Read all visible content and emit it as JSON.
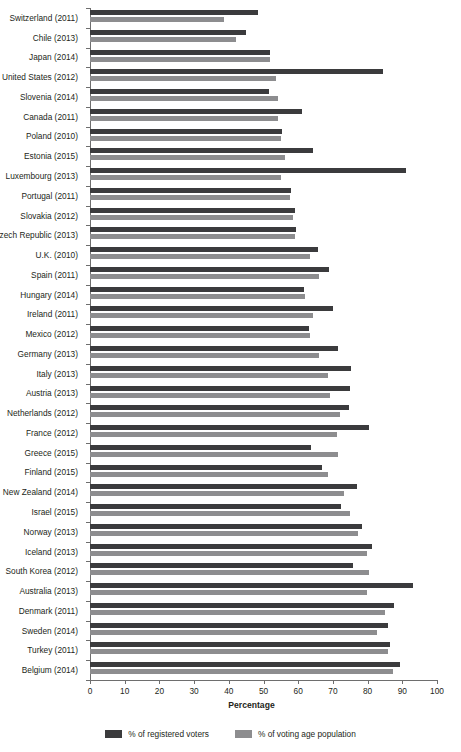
{
  "chart_data": {
    "type": "bar",
    "orientation": "horizontal",
    "title": "",
    "xlabel": "Percentage",
    "ylabel": "",
    "xlim": [
      0,
      100
    ],
    "xticks": [
      0,
      10,
      20,
      30,
      40,
      50,
      60,
      70,
      80,
      90,
      100
    ],
    "grid": false,
    "legend_position": "bottom",
    "categories": [
      "Switzerland (2011)",
      "Chile (2013)",
      "Japan (2014)",
      "United States (2012)",
      "Slovenia (2014)",
      "Canada (2011)",
      "Poland (2010)",
      "Estonia (2015)",
      "Luxembourg (2013)",
      "Portugal (2011)",
      "Slovakia (2012)",
      "Czech Republic (2013)",
      "U.K. (2010)",
      "Spain (2011)",
      "Hungary (2014)",
      "Ireland (2011)",
      "Mexico (2012)",
      "Germany (2013)",
      "Italy (2013)",
      "Austria (2013)",
      "Netherlands (2012)",
      "France (2012)",
      "Greece (2015)",
      "Finland (2015)",
      "New Zealand (2014)",
      "Israel (2015)",
      "Norway (2013)",
      "Iceland (2013)",
      "South Korea (2012)",
      "Australia (2013)",
      "Denmark (2011)",
      "Sweden (2014)",
      "Turkey (2011)",
      "Belgium (2014)"
    ],
    "series": [
      {
        "name": "% of registered voters",
        "color": "#3b3b3d",
        "values": [
          48.5,
          45.0,
          52.0,
          84.3,
          51.7,
          61.1,
          55.3,
          64.2,
          91.2,
          58.0,
          59.1,
          59.5,
          65.8,
          68.9,
          61.8,
          69.9,
          63.1,
          71.5,
          75.2,
          74.9,
          74.6,
          80.3,
          63.6,
          66.8,
          77.0,
          72.3,
          78.3,
          81.4,
          75.8,
          93.2,
          87.7,
          85.8,
          86.4,
          89.4
        ],
        "unit": "%"
      },
      {
        "name": "% of voting age population",
        "color": "#8d8d8f",
        "values": [
          38.6,
          42.0,
          51.8,
          53.6,
          54.1,
          54.2,
          55.0,
          56.2,
          55.1,
          57.7,
          58.6,
          59.2,
          63.3,
          66.0,
          62.1,
          64.3,
          63.4,
          66.1,
          68.6,
          69.1,
          72.0,
          71.2,
          71.5,
          68.6,
          73.2,
          75.0,
          77.1,
          79.9,
          80.4,
          79.7,
          85.0,
          82.6,
          86.0,
          87.2
        ],
        "unit": "%"
      }
    ]
  },
  "axis": {
    "x_title": "Percentage"
  },
  "legend": {
    "items": [
      {
        "label": "% of registered voters",
        "color": "#3b3b3d"
      },
      {
        "label": "% of voting age population",
        "color": "#8d8d8f"
      }
    ]
  }
}
